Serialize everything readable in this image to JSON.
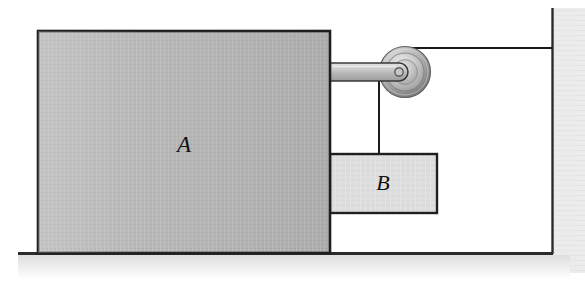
{
  "figure": {
    "background_color": "#ffffff"
  },
  "labels": {
    "block_a": "A",
    "block_b": "B"
  },
  "colors": {
    "block_a_fill": "#b4b4b4",
    "block_b_fill": "#dcdcdc",
    "outline": "#1a1a1a",
    "ground_line": "#2b2b2b",
    "wall_line": "#2b2b2b",
    "wall_shadow": "#e8e8e8",
    "ground_shadow": "#ededed",
    "rod_fill": "#c8c8c8",
    "pulley_rim": "#8c8c8c",
    "pulley_face": "#c9c9c9",
    "cord": "#1a1a1a"
  },
  "geometry": {
    "block_a": {
      "x": 38,
      "y": 31,
      "width": 292,
      "height": 222
    },
    "block_b": {
      "x": 330,
      "y": 154,
      "width": 107,
      "height": 59
    },
    "rod": {
      "x": 330,
      "y": 63,
      "width": 80,
      "height": 18
    },
    "pulley": {
      "cx": 405,
      "cy": 72,
      "r_outer": 25,
      "r_mid": 18,
      "r_inner": 11,
      "r_hub": 4
    },
    "cord_horizontal": {
      "x1": 405,
      "y1": 48,
      "x2": 552,
      "y2": 48
    },
    "cord_vertical": {
      "x1": 379,
      "y1": 72,
      "x2": 379,
      "y2": 154
    },
    "ground": {
      "x1": 18,
      "y1": 253,
      "x2": 553,
      "y2": 253
    },
    "wall": {
      "x": 552,
      "y1": 8,
      "y2": 253
    }
  },
  "elements": {
    "block_a_name": "block-a",
    "block_b_name": "block-b",
    "pulley_name": "pulley",
    "rod_name": "pulley-bracket-rod",
    "cord_h_name": "cord-horizontal",
    "cord_v_name": "cord-vertical",
    "ground_name": "ground-surface",
    "wall_name": "wall"
  }
}
